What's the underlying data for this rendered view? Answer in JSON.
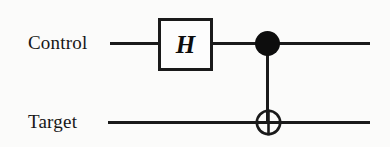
{
  "diagram": {
    "type": "quantum-circuit",
    "background_color": "#fbfbfa",
    "ink_color": "#1a1a1a"
  },
  "wires": [
    {
      "id": "control",
      "label": "Control",
      "y": 43
    },
    {
      "id": "target",
      "label": "Target",
      "y": 122
    }
  ],
  "gates": [
    {
      "id": "hadamard",
      "symbol": "H",
      "kind": "single-qubit-box",
      "wire": "control",
      "box": {
        "x": 158,
        "y": 18,
        "width": 55,
        "height": 53
      }
    },
    {
      "id": "cnot",
      "kind": "controlled-not",
      "control_wire": "control",
      "target_wire": "target",
      "control_marker": "filled-dot",
      "target_marker": "xor-circle",
      "x": 268
    }
  ]
}
